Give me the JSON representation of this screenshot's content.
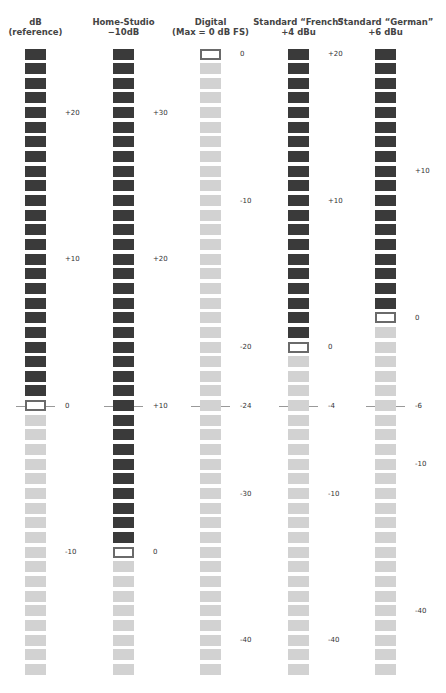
{
  "chart_data": {
    "type": "diagram",
    "segments_per_meter": 43,
    "segment_pitch_px": 14.65,
    "first_segment_center_y": 54,
    "colors": {
      "above": "#3a3a3a",
      "below": "#d2d2d2",
      "reference_border": "#6a6a6a"
    },
    "alignment_row_index": 24,
    "meters": [
      {
        "name": "dB (reference)",
        "title_lines": [
          "dB",
          "(reference)"
        ],
        "x": 25,
        "ref_index": 24,
        "labels": [
          {
            "text": "+20",
            "idx": 4
          },
          {
            "text": "+10",
            "idx": 14
          },
          {
            "text": "0",
            "idx": 24
          },
          {
            "text": "-10",
            "idx": 34
          }
        ]
      },
      {
        "name": "Home-Studio -10dB",
        "title_lines": [
          "Home-Studio",
          "−10dB"
        ],
        "x": 113,
        "ref_index": 34,
        "labels": [
          {
            "text": "+30",
            "idx": 4
          },
          {
            "text": "+20",
            "idx": 14
          },
          {
            "text": "+10",
            "idx": 24
          },
          {
            "text": "0",
            "idx": 34
          }
        ]
      },
      {
        "name": "Digital (Max = 0 dB FS)",
        "title_lines": [
          "Digital",
          "(Max = 0 dB FS)"
        ],
        "x": 200,
        "ref_index": 0,
        "labels": [
          {
            "text": "0",
            "idx": 0
          },
          {
            "text": "-10",
            "idx": 10
          },
          {
            "text": "-20",
            "idx": 20
          },
          {
            "text": "-24",
            "idx": 24
          },
          {
            "text": "-30",
            "idx": 30
          },
          {
            "text": "-40",
            "idx": 40
          }
        ]
      },
      {
        "name": "Standard “French” +4 dBu",
        "title_lines": [
          "Standard “French”",
          "+4 dBu"
        ],
        "x": 288,
        "ref_index": 20,
        "labels": [
          {
            "text": "+20",
            "idx": 0
          },
          {
            "text": "+10",
            "idx": 10
          },
          {
            "text": "0",
            "idx": 20
          },
          {
            "text": "-4",
            "idx": 24
          },
          {
            "text": "-10",
            "idx": 30
          },
          {
            "text": "-40",
            "idx": 40
          }
        ]
      },
      {
        "name": "Standard “German” +6 dBu",
        "title_lines": [
          "Standard “German”",
          "+6 dBu"
        ],
        "x": 375,
        "ref_index": 18,
        "labels": [
          {
            "text": "+10",
            "idx": 8
          },
          {
            "text": "0",
            "idx": 18
          },
          {
            "text": "-6",
            "idx": 24
          },
          {
            "text": "-10",
            "idx": 28
          },
          {
            "text": "-40",
            "idx": 38
          }
        ]
      }
    ]
  }
}
